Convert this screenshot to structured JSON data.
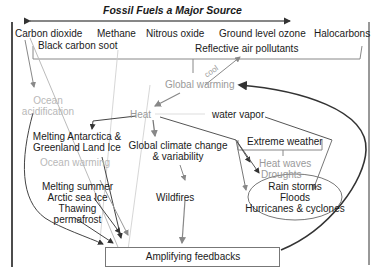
{
  "title": "Fossil Fuels a Major Source",
  "sources": {
    "carbon_dioxide": "Carbon dioxide",
    "methane": "Methane",
    "nitrous_oxide": "Nitrous oxide",
    "ground_ozone": "Ground level ozone",
    "halocarbons": "Halocarbons",
    "black_carbon": "Black carbon soot",
    "reflective": "Reflective air pollutants"
  },
  "cool_label": "cool",
  "nodes": {
    "global_warming": "Global warming",
    "ocean_acid_1": "Ocean",
    "ocean_acid_2": "acidification",
    "heat": "Heat",
    "water_vapor": "water vapor",
    "melting_ant_1": "Melting Antarctica &",
    "melting_ant_2": "Greenland Land Ice",
    "ocean_warming": "Ocean warming",
    "global_climate_1": "Global climate change",
    "global_climate_2": "& variability",
    "extreme_weather": "Extreme weather",
    "heat_waves": "Heat waves",
    "droughts": "Droughts",
    "rain_storms": "Rain storms",
    "floods": "Floods",
    "hurricanes": "Hurricanes & cyclones",
    "melting_arctic_1": "Melting summer",
    "melting_arctic_2": "Arctic sea Ice",
    "thawing_1": "Thawing",
    "thawing_2": "permafrost",
    "wildfires": "Wildfires",
    "amplifying": "Amplifying feedbacks"
  },
  "colors": {
    "dark": "#222222",
    "line": "#555555",
    "gray": "#9a9a9a",
    "light": "#c0c0c0"
  }
}
